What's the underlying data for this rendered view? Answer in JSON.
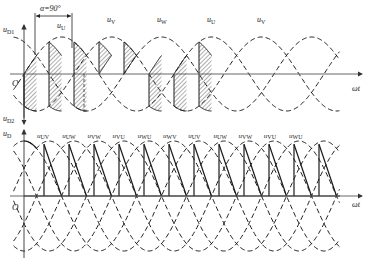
{
  "colors": {
    "background": "#ffffff",
    "axis": "#555555",
    "curve": "#1a1a1a",
    "text": "#1a1a1a"
  },
  "top_panel": {
    "y_label_main": "u",
    "y_label_sub": "D1",
    "y_label_lower_main": "u",
    "y_label_lower_sub": "D2",
    "origin_label": "O",
    "x_axis_label": "ωt",
    "alpha_annotation": "α=90°",
    "phase_labels": [
      {
        "main": "u",
        "sub": "U",
        "x": 60
      },
      {
        "main": "u",
        "sub": "V",
        "x": 110
      },
      {
        "main": "u",
        "sub": "W",
        "x": 160
      },
      {
        "main": "u",
        "sub": "U",
        "x": 210
      },
      {
        "main": "u",
        "sub": "V",
        "x": 260
      }
    ]
  },
  "bottom_panel": {
    "y_label_main": "u",
    "y_label_sub": "D",
    "origin_label": "O",
    "x_axis_label": "ωt",
    "line_labels": [
      {
        "main": "u",
        "sub": "UV"
      },
      {
        "main": "u",
        "sub": "UW"
      },
      {
        "main": "u",
        "sub": "VW"
      },
      {
        "main": "u",
        "sub": "VU"
      },
      {
        "main": "u",
        "sub": "WU"
      },
      {
        "main": "u",
        "sub": "WV"
      },
      {
        "main": "u",
        "sub": "UV"
      },
      {
        "main": "u",
        "sub": "UW"
      },
      {
        "main": "u",
        "sub": "VW"
      },
      {
        "main": "u",
        "sub": "VU"
      },
      {
        "main": "u",
        "sub": "WU"
      }
    ]
  },
  "chart_data": [
    {
      "type": "line",
      "title": "Half-wave diode voltage, three-phase, α=90°",
      "xlabel": "ωt",
      "ylabel": "uD1 / uD2",
      "series": [
        {
          "name": "uU",
          "phase_deg": 0,
          "style": "dashed"
        },
        {
          "name": "uV",
          "phase_deg": -120,
          "style": "dashed"
        },
        {
          "name": "uW",
          "phase_deg": 120,
          "style": "dashed"
        }
      ],
      "annotation": "α=90°",
      "hatched_regions": "uD1 above axis, uD2 below axis",
      "grid": false
    },
    {
      "type": "line",
      "title": "Line voltages with diode output uD",
      "xlabel": "ωt",
      "ylabel": "uD",
      "series": [
        {
          "name": "uUV"
        },
        {
          "name": "uUW"
        },
        {
          "name": "uVW"
        },
        {
          "name": "uVU"
        },
        {
          "name": "uWU"
        },
        {
          "name": "uWV"
        }
      ],
      "grid": false
    }
  ]
}
